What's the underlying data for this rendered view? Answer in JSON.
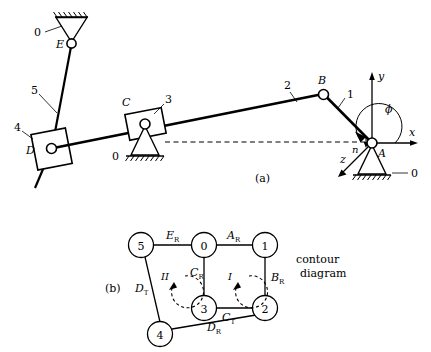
{
  "figure": {
    "part_a_label": "(a)",
    "part_b_label": "(b)",
    "caption_line1": "contour",
    "caption_line2": "diagram"
  },
  "mechanism": {
    "joint_labels": {
      "A": "A",
      "B": "B",
      "C": "C",
      "D": "D",
      "E": "E"
    },
    "link_labels": {
      "link0_E": "0",
      "link0_C": "0",
      "link0_A": "0",
      "link1": "1",
      "link2": "2",
      "link3": "3",
      "link4": "4",
      "link5": "5"
    },
    "axes": {
      "x": "x",
      "y": "y",
      "z": "z",
      "angle": "ϕ",
      "normal": "n"
    }
  },
  "contour": {
    "nodes": [
      {
        "id": "node-5",
        "label": "5"
      },
      {
        "id": "node-0",
        "label": "0"
      },
      {
        "id": "node-1",
        "label": "1"
      },
      {
        "id": "node-3",
        "label": "3"
      },
      {
        "id": "node-2",
        "label": "2"
      },
      {
        "id": "node-4",
        "label": "4"
      }
    ],
    "edges": [
      {
        "id": "edge-ER",
        "base": "E",
        "sub": "R"
      },
      {
        "id": "edge-AR",
        "base": "A",
        "sub": "R"
      },
      {
        "id": "edge-BR",
        "base": "B",
        "sub": "R"
      },
      {
        "id": "edge-CR",
        "base": "C",
        "sub": "R"
      },
      {
        "id": "edge-CT",
        "base": "C",
        "sub": "T"
      },
      {
        "id": "edge-DT",
        "base": "D",
        "sub": "T"
      },
      {
        "id": "edge-DR",
        "base": "D",
        "sub": "R"
      }
    ],
    "loops": [
      {
        "id": "loop-I",
        "label": "I"
      },
      {
        "id": "loop-II",
        "label": "II"
      }
    ]
  },
  "colors": {
    "ink": "#000000",
    "background": "#ffffff"
  }
}
